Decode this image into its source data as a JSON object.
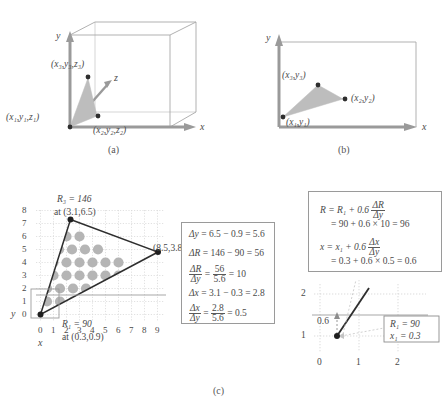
{
  "figure": {
    "panels": [
      {
        "id": "a",
        "caption": "(a)",
        "description": "3D bounding box with triangle and vertex labels"
      },
      {
        "id": "b",
        "caption": "(b)",
        "description": "2D projected triangle with vertex labels"
      },
      {
        "id": "c",
        "caption": "(c)",
        "description": "Rasterized triangle with scan-line interpolation math"
      }
    ]
  },
  "panel_a": {
    "caption": "(a)",
    "axis_x": "x",
    "axis_y": "y",
    "axis_z": "z",
    "vertex_1": "(x₁,y₁,z₁)",
    "vertex_2": "(x₂,y₂,z₂)",
    "vertex_3": "(x₃,y₃,z₃)"
  },
  "panel_b": {
    "caption": "(b)",
    "axis_x": "x",
    "axis_y": "y",
    "vertex_1": "(x₁,y₁)",
    "vertex_2": "(x₂,y₂)",
    "vertex_3": "(x₃,y₃)"
  },
  "panel_c": {
    "caption": "(c)",
    "grid": {
      "axis_x_label": "x",
      "axis_y_label": "y",
      "x_ticks": [
        "0",
        "1",
        "2",
        "3",
        "4",
        "5",
        "6",
        "7",
        "8",
        "9"
      ],
      "y_ticks": [
        "8",
        "7",
        "6",
        "5",
        "4",
        "3",
        "2",
        "1",
        "0"
      ],
      "top_vertex_value": "R₃ = 146",
      "top_vertex_at": "at (3.1,6.5)",
      "right_vertex_at": "(8.5,3.8)",
      "bottom_vertex_value": "R₁ = 90",
      "bottom_vertex_at": "at (0.3,0.9)"
    },
    "equations_left": [
      {
        "label": "Δy",
        "body": "= 6.5 − 0.9 = 5.6"
      },
      {
        "label": "ΔR",
        "body": "= 146 − 90 = 56"
      },
      {
        "label": "ΔR/Δy",
        "body": "= 56/5.6 = 10",
        "num": "56",
        "den": "5.6",
        "result": "= 10"
      },
      {
        "label": "Δx",
        "body": "= 3.1 − 0.3 = 2.8"
      },
      {
        "label": "Δx/Δy",
        "body": "= 2.8/5.6 = 0.5",
        "num": "2.8",
        "den": "5.6",
        "result": "= 0.5"
      }
    ],
    "equations_right": {
      "line1_lhs": "R = R₁ + 0.6",
      "line1_frac_num": "ΔR",
      "line1_frac_den": "Δy",
      "line2": "= 90 + 0.6 × 10 = 96",
      "line3_lhs": "x = x₁ + 0.6",
      "line3_frac_num": "Δx",
      "line3_frac_den": "Δy",
      "line4": "= 0.3 + 0.6 × 0.5 = 0.6"
    },
    "inset": {
      "y_ticks": [
        "2",
        "1"
      ],
      "x_ticks": [
        "0",
        "1",
        "2"
      ],
      "offset_label": "0.6",
      "box_line1": "R₁ = 90",
      "box_line2": "x₁ = 0.3"
    }
  },
  "colors": {
    "triangle_fill": "#b3b3b3",
    "axis": "#8c8c8c",
    "line": "#3d3d3d",
    "grid": "#d8d8d8",
    "dot": "#b0b0b0",
    "text": "#4a4a4a",
    "box_border": "#9a9a9a"
  }
}
